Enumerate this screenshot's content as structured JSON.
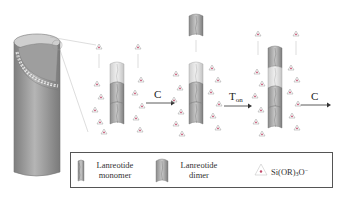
{
  "figure": {
    "type": "schematic"
  },
  "steps": [
    {
      "id": "step1",
      "arrow_label": "C"
    },
    {
      "id": "step2",
      "arrow_label_main": "T",
      "arrow_label_sub": "on"
    },
    {
      "id": "step3",
      "arrow_label": "C"
    }
  ],
  "legend": {
    "items": [
      {
        "icon": "lanreotide-monomer-icon",
        "line1": "Lanreotide",
        "line2": "monomer"
      },
      {
        "icon": "lanreotide-dimer-icon",
        "line1": "Lanreotide",
        "line2": "dimer"
      },
      {
        "icon": "silicate-icon",
        "label_main": "Si(OR)",
        "label_sub": "3",
        "label_tail": "O",
        "label_sup": "−"
      }
    ]
  },
  "colors": {
    "tube_dark": "#8a8a8a",
    "tube_mid": "#a9a9a9",
    "tube_light": "#d6d6d6",
    "silicate_point": "#c24a6a",
    "line": "#666666"
  }
}
